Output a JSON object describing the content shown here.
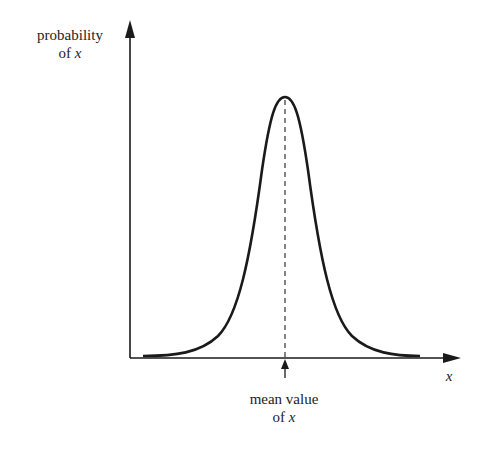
{
  "diagram": {
    "y_axis": {
      "label_line1": "probability",
      "label_line2_prefix": "of ",
      "label_line2_var": "x"
    },
    "x_axis": {
      "label": "x"
    },
    "mean_marker": {
      "label_line1": "mean value",
      "label_line2_prefix": "of ",
      "label_line2_var": "x"
    },
    "colors": {
      "stroke": "#1a1a1a",
      "text": "#222222",
      "background": "#ffffff"
    }
  }
}
